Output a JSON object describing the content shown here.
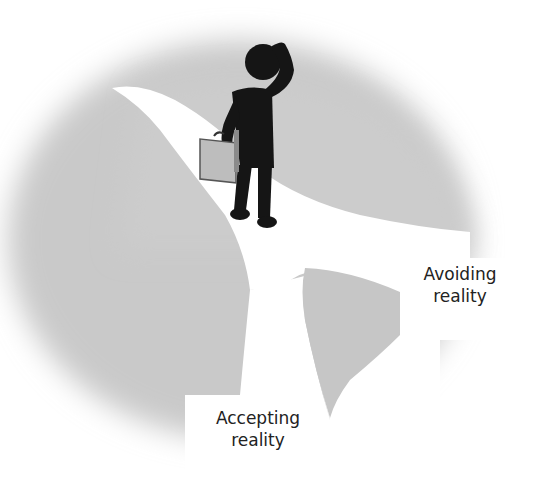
{
  "diagram": {
    "labels": {
      "avoiding": {
        "line1": "Avoiding",
        "line2": "reality"
      },
      "accepting": {
        "line1": "Accepting",
        "line2": "reality"
      }
    },
    "elements": {
      "figure": "person-with-briefcase-scratching-head",
      "path": "fork-in-road",
      "background": "gray-blurred-circle"
    },
    "colors": {
      "ground": "#c8c8c8",
      "path": "#ffffff",
      "figure": "#151515",
      "briefcase": "#b9b9b9",
      "text": "#222222"
    }
  }
}
